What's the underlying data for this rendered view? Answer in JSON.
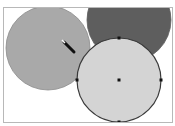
{
  "canvas": {
    "shapes": [
      {
        "id": "circle-left",
        "cx": 44,
        "cy": 40,
        "r": 42,
        "fill": "#a9a9a9",
        "stroke": "#8a8a8a",
        "selected": false
      },
      {
        "id": "circle-top-right",
        "cx": 125,
        "cy": 12,
        "r": 42,
        "fill": "#5e5e5e",
        "stroke": "#5e5e5e",
        "selected": false
      },
      {
        "id": "circle-selected",
        "cx": 115,
        "cy": 72,
        "r": 42,
        "fill": "#d4d4d4",
        "stroke": "#3a3a3a",
        "selected": true
      }
    ],
    "selection_handles": [
      "top",
      "left",
      "right",
      "bottom",
      "center"
    ],
    "cursor": {
      "icon": "pen-cursor-icon",
      "x": 60,
      "y": 34
    }
  }
}
